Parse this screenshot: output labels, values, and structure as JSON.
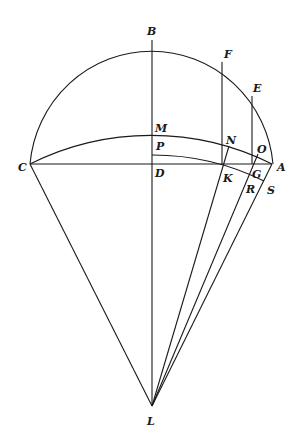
{
  "diagram": {
    "type": "geometric-construction",
    "stroke_color": "#1a1a1a",
    "background": "#ffffff",
    "points": {
      "B": {
        "x": 152,
        "y": 40
      },
      "F": {
        "x": 222,
        "y": 62
      },
      "E": {
        "x": 252,
        "y": 96
      },
      "M": {
        "x": 152,
        "y": 136
      },
      "N": {
        "x": 222,
        "y": 146
      },
      "O": {
        "x": 252,
        "y": 155
      },
      "P": {
        "x": 152,
        "y": 155
      },
      "C": {
        "x": 30,
        "y": 164
      },
      "D": {
        "x": 152,
        "y": 164
      },
      "K": {
        "x": 222,
        "y": 164
      },
      "G": {
        "x": 252,
        "y": 164
      },
      "A": {
        "x": 272,
        "y": 164
      },
      "R": {
        "x": 247,
        "y": 177
      },
      "S": {
        "x": 264,
        "y": 181
      },
      "L": {
        "x": 152,
        "y": 406
      }
    },
    "labels": [
      {
        "id": "B",
        "text": "B",
        "x": 147,
        "y": 35
      },
      {
        "id": "F",
        "text": "F",
        "x": 224,
        "y": 58
      },
      {
        "id": "E",
        "text": "E",
        "x": 253,
        "y": 92
      },
      {
        "id": "M",
        "text": "M",
        "x": 155,
        "y": 132
      },
      {
        "id": "N",
        "text": "N",
        "x": 226,
        "y": 144
      },
      {
        "id": "P",
        "text": "P",
        "x": 156,
        "y": 150
      },
      {
        "id": "O",
        "text": "O",
        "x": 257,
        "y": 153
      },
      {
        "id": "C",
        "text": "C",
        "x": 18,
        "y": 171
      },
      {
        "id": "A",
        "text": "A",
        "x": 277,
        "y": 171
      },
      {
        "id": "D",
        "text": "D",
        "x": 155,
        "y": 177
      },
      {
        "id": "G",
        "text": "G",
        "x": 252,
        "y": 178
      },
      {
        "id": "K",
        "text": "K",
        "x": 223,
        "y": 182
      },
      {
        "id": "R",
        "text": "R",
        "x": 246,
        "y": 193
      },
      {
        "id": "S",
        "text": "S",
        "x": 267,
        "y": 194
      },
      {
        "id": "L",
        "text": "L",
        "x": 147,
        "y": 425
      }
    ],
    "elements": [
      {
        "kind": "semicircle",
        "name": "circle-CBA",
        "center": "D",
        "radius": 121
      },
      {
        "kind": "segment",
        "name": "line-CA",
        "from": "C",
        "to": "A"
      },
      {
        "kind": "segment",
        "name": "line-BL",
        "from": "B",
        "to": "L"
      },
      {
        "kind": "segment",
        "name": "line-FK",
        "from": "F",
        "to": "K"
      },
      {
        "kind": "segment",
        "name": "line-EG",
        "from": "E",
        "to": "G"
      },
      {
        "kind": "segment",
        "name": "line-CL",
        "from": "C",
        "to": "L"
      },
      {
        "kind": "segment",
        "name": "line-LN",
        "from": "L",
        "to": "N"
      },
      {
        "kind": "segment",
        "name": "line-LO",
        "from": "L",
        "to": "O"
      },
      {
        "kind": "segment",
        "name": "line-LA",
        "from": "L",
        "to": "A"
      },
      {
        "kind": "arc",
        "name": "arc-CMA",
        "center": "L",
        "radius": 270
      },
      {
        "kind": "arc",
        "name": "arc-PKS",
        "center": "L",
        "radius": 251
      }
    ]
  }
}
